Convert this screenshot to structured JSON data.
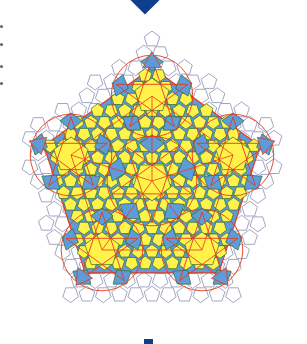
{
  "figure": {
    "colors": {
      "marker": "#0d3f8f",
      "pentagon_fill": "#fff24a",
      "rhombus_fill": "#5e9bd8",
      "outer_pentagon_stroke": "#8a8fb0",
      "tile_edge": "#2e6a2e",
      "red_line": "#e8391c",
      "side_dot": "#556070"
    },
    "center": [
      152,
      181
    ],
    "outer_radius": 142,
    "rosettes": [
      {
        "cx": 152,
        "cy": 181,
        "r": 44,
        "role": "center"
      },
      {
        "cx": 152,
        "cy": 96,
        "r": 40,
        "role": "top"
      },
      {
        "cx": 233,
        "cy": 155,
        "r": 40,
        "role": "upper-right"
      },
      {
        "cx": 202,
        "cy": 250,
        "r": 40,
        "role": "lower-right"
      },
      {
        "cx": 102,
        "cy": 250,
        "r": 40,
        "role": "lower-left"
      },
      {
        "cx": 71,
        "cy": 155,
        "r": 40,
        "role": "upper-left"
      }
    ],
    "side_dots_y": [
      25,
      43,
      65,
      82
    ]
  }
}
